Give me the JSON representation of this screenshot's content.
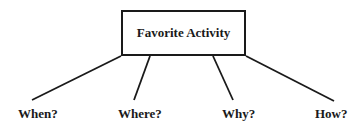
{
  "diagram": {
    "type": "tree",
    "root": {
      "label": "Favorite Activity"
    },
    "branches": [
      {
        "label": "When?"
      },
      {
        "label": "Where?"
      },
      {
        "label": "Why?"
      },
      {
        "label": "How?"
      }
    ],
    "colors": {
      "line": "#1a1a1a",
      "text": "#1a1a1a",
      "background": "#ffffff"
    }
  }
}
